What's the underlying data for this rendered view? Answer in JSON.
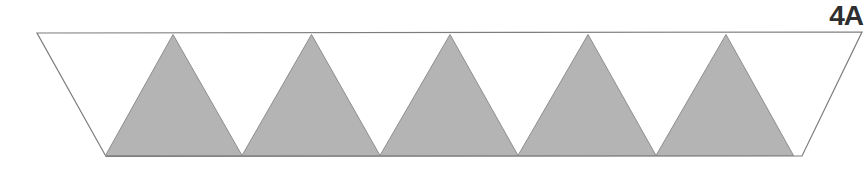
{
  "figure": {
    "label": "4A",
    "colors": {
      "background": "#ffffff",
      "trapezoid_fill": "#ffffff",
      "triangle_fill": "#b4b4b4",
      "triangle_edge": "#8e8e8e",
      "outline": "#7d7d7d",
      "label_color": "#2f2f2f"
    },
    "trapezoid": {
      "points": [
        [
          37,
          33
        ],
        [
          862,
          32
        ],
        [
          802,
          156
        ],
        [
          106,
          156.5
        ]
      ]
    },
    "shaded_triangles": [
      {
        "apex": [
          173,
          34.5
        ],
        "base_left": [
          105.5,
          155.5
        ],
        "base_right": [
          242,
          155.5
        ]
      },
      {
        "apex": [
          311.5,
          34.5
        ],
        "base_left": [
          242,
          155.5
        ],
        "base_right": [
          380,
          155.5
        ]
      },
      {
        "apex": [
          450,
          34.5
        ],
        "base_left": [
          380,
          155.5
        ],
        "base_right": [
          518,
          155.5
        ]
      },
      {
        "apex": [
          588,
          34.5
        ],
        "base_left": [
          518,
          155.5
        ],
        "base_right": [
          656,
          155.5
        ]
      },
      {
        "apex": [
          726,
          34.5
        ],
        "base_left": [
          656,
          155.5
        ],
        "base_right": [
          793.5,
          155.5
        ]
      }
    ]
  }
}
